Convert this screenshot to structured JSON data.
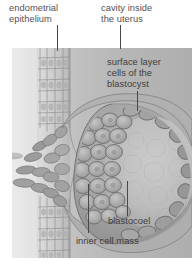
{
  "figure": {
    "type": "biological-illustration",
    "palette": {
      "page_background": "#ffffff",
      "panel_left_band": "#ececec",
      "uterine_cavity": "#b9b9b9",
      "endometrium_tissue": "#c9c9c9",
      "blastocyst_body": "#a8a8a8",
      "blastocoel": "#c2c2c2",
      "cell_outline": "#6e6b6c",
      "label_text": "#555153",
      "leader_line": "#4a4748"
    }
  },
  "labels": {
    "endometrial_epithelium": {
      "line1": "endometrial",
      "line2": "epithelium"
    },
    "cavity_inside_uterus": {
      "line1": "cavity inside",
      "line2": "the uterus"
    },
    "surface_layer_cells": {
      "line1": "surface layer",
      "line2": "cells of the",
      "line3": "blastocyst"
    },
    "blastocoel": {
      "line1": "blastocoel"
    },
    "inner_cell_mass": {
      "line1": "inner cell mass"
    }
  }
}
